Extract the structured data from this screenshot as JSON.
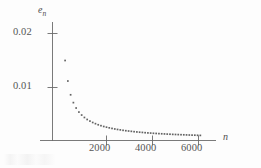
{
  "figure": {
    "background_color": "#fdfdfd",
    "ink_color": "#5a5a5a",
    "marker_color": "#636363"
  },
  "labels": {
    "y_axis_name_base": "e",
    "y_axis_name_sub": "n",
    "x_axis_name": "n",
    "y_ticks": [
      "0.02",
      "0.01"
    ],
    "x_ticks": [
      "2000",
      "4000",
      "6000"
    ]
  },
  "chart_data": {
    "type": "scatter",
    "title": "",
    "xlabel": "n",
    "ylabel": "e_n",
    "xlim": [
      0,
      6400
    ],
    "ylim": [
      0,
      0.0225
    ],
    "grid": false,
    "legend": null,
    "xticks": [
      2000,
      4000,
      6000
    ],
    "yticks": [
      0.01,
      0.02
    ],
    "marker": "square-dot",
    "marker_size_px": 1.7,
    "series": [
      {
        "name": "e_n",
        "x": [
          200,
          320,
          440,
          560,
          680,
          800,
          920,
          1040,
          1160,
          1280,
          1400,
          1520,
          1640,
          1760,
          1880,
          2000,
          2120,
          2240,
          2360,
          2480,
          2600,
          2720,
          2840,
          2960,
          3080,
          3200,
          3320,
          3440,
          3560,
          3680,
          3800,
          3920,
          4040,
          4160,
          4280,
          4400,
          4520,
          4640,
          4760,
          4880,
          5000,
          5120,
          5240,
          5360,
          5480,
          5600,
          5720,
          5840,
          5960,
          6080
        ],
        "y": [
          0.015,
          0.0112,
          0.00865,
          0.0072,
          0.0062,
          0.00545,
          0.0049,
          0.00445,
          0.00408,
          0.00378,
          0.00352,
          0.0033,
          0.0031,
          0.00293,
          0.00278,
          0.00265,
          0.00253,
          0.00242,
          0.00232,
          0.00223,
          0.00215,
          0.00207,
          0.002,
          0.00194,
          0.00188,
          0.00182,
          0.00177,
          0.00172,
          0.00168,
          0.00163,
          0.00159,
          0.00156,
          0.00152,
          0.00149,
          0.00146,
          0.00143,
          0.0014,
          0.00137,
          0.00135,
          0.00132,
          0.0013,
          0.00128,
          0.00126,
          0.00124,
          0.00122,
          0.0012,
          0.00118,
          0.00117,
          0.00115,
          0.00113
        ]
      }
    ]
  }
}
